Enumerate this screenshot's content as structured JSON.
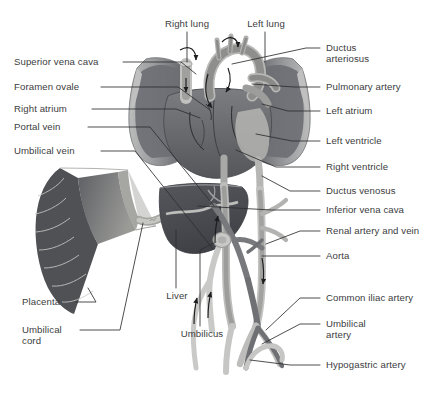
{
  "diagram": {
    "style": "grayscale medical illustration",
    "background_color": "#ffffff",
    "text_color": "#3c3c3e",
    "leader_line_color": "#2e2e30"
  },
  "palette": {
    "lung_outer": "#b9b9b9",
    "lung_inner": "#6f7174",
    "heart_dark": "#5b5d61",
    "heart_mid": "#8e9094",
    "vessel_light": "#c3c3c1",
    "vessel_mid": "#9a9a98",
    "vessel_dark": "#6a6a6a",
    "liver_dark": "#4b4d52",
    "placenta_lobule": "#5a5c60",
    "placenta_membrane": "#a9a9a6",
    "outline": "#55575b"
  },
  "labels": {
    "top": [
      {
        "id": "right-lung",
        "text": "Right lung",
        "x": 158,
        "y": 18,
        "w": 58
      },
      {
        "id": "left-lung",
        "text": "Left lung",
        "x": 240,
        "y": 18,
        "w": 52
      }
    ],
    "left": [
      {
        "id": "superior-vena-cava",
        "text": "Superior vena cava",
        "x": 14,
        "y": 58
      },
      {
        "id": "foramen-ovale",
        "text": "Foramen ovale",
        "x": 14,
        "y": 83
      },
      {
        "id": "right-atrium",
        "text": "Right atrium",
        "x": 14,
        "y": 105
      },
      {
        "id": "portal-vein",
        "text": "Portal vein",
        "x": 14,
        "y": 123
      },
      {
        "id": "umbilical-vein",
        "text": "Umbilical vein",
        "x": 14,
        "y": 147
      },
      {
        "id": "placenta",
        "text": "Placenta",
        "x": 22,
        "y": 299
      },
      {
        "id": "umbilical-cord",
        "text": "Umbilical\ncord",
        "x": 22,
        "y": 326
      }
    ],
    "center": [
      {
        "id": "liver",
        "text": "Liver",
        "x": 164,
        "y": 293
      },
      {
        "id": "umbilicus",
        "text": "Umbilicus",
        "x": 176,
        "y": 331
      }
    ],
    "right": [
      {
        "id": "ductus-arteriosus",
        "text": "Ductus\narteriosus",
        "x": 326,
        "y": 44
      },
      {
        "id": "pulmonary-artery",
        "text": "Pulmonary artery",
        "x": 326,
        "y": 83
      },
      {
        "id": "left-atrium",
        "text": "Left atrium",
        "x": 326,
        "y": 107
      },
      {
        "id": "left-ventricle",
        "text": "Left ventricle",
        "x": 326,
        "y": 137
      },
      {
        "id": "right-ventricle",
        "text": "Right ventricle",
        "x": 326,
        "y": 163
      },
      {
        "id": "ductus-venosus",
        "text": "Ductus venosus",
        "x": 326,
        "y": 187
      },
      {
        "id": "inferior-vena-cava",
        "text": "Inferior vena cava",
        "x": 326,
        "y": 206
      },
      {
        "id": "renal-artery-and-vein",
        "text": "Renal artery and vein",
        "x": 326,
        "y": 227
      },
      {
        "id": "aorta",
        "text": "Aorta",
        "x": 326,
        "y": 252
      },
      {
        "id": "common-iliac-artery",
        "text": "Common iliac artery",
        "x": 326,
        "y": 294
      },
      {
        "id": "umbilical-artery",
        "text": "Umbilical\nartery",
        "x": 326,
        "y": 320
      },
      {
        "id": "hypogastric-artery",
        "text": "Hypogastric artery",
        "x": 326,
        "y": 361
      }
    ]
  },
  "structures": [
    "right lung",
    "left lung",
    "heart",
    "aortic arch",
    "superior vena cava",
    "inferior vena cava",
    "ductus arteriosus",
    "ductus venosus",
    "liver",
    "portal vein",
    "umbilical vein",
    "umbilical arteries",
    "placenta",
    "umbilical cord",
    "aorta",
    "common iliac artery",
    "hypogastric artery",
    "renal artery and vein"
  ],
  "flow_arrows": {
    "count": 9,
    "description": "curved black arrows indicating direction of fetal blood flow"
  }
}
